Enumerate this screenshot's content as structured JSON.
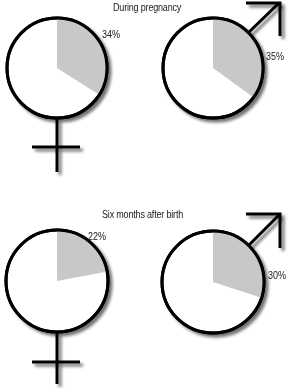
{
  "chart_data": [
    {
      "type": "pie",
      "title": "During pregnancy",
      "series": [
        {
          "name": "Female",
          "symbol": "female",
          "value": 34,
          "label": "34%"
        },
        {
          "name": "Male",
          "symbol": "male",
          "value": 35,
          "label": "35%"
        }
      ]
    },
    {
      "type": "pie",
      "title": "Six months after birth",
      "series": [
        {
          "name": "Female",
          "symbol": "female",
          "value": 22,
          "label": "22%"
        },
        {
          "name": "Male",
          "symbol": "male",
          "value": 30,
          "label": "30%"
        }
      ]
    }
  ],
  "colors": {
    "slice": "#c8c8c8",
    "outline": "#000000",
    "background": "#ffffff"
  }
}
